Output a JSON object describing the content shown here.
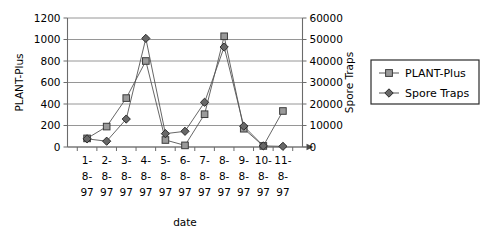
{
  "chart_data": {
    "type": "line",
    "title": "",
    "xlabel": "date",
    "categories": [
      "1-8-97",
      "2-8-97",
      "3-8-97",
      "4-8-97",
      "5-8-97",
      "6-8-97",
      "7-8-97",
      "8-8-97",
      "9-8-97",
      "10-8-97",
      "11-8-97"
    ],
    "category_lines": [
      [
        "1-",
        "8-",
        "97"
      ],
      [
        "2-",
        "8-",
        "97"
      ],
      [
        "3-",
        "8-",
        "97"
      ],
      [
        "4-",
        "8-",
        "97"
      ],
      [
        "5-",
        "8-",
        "97"
      ],
      [
        "6-",
        "8-",
        "97"
      ],
      [
        "7-",
        "8-",
        "97"
      ],
      [
        "8-",
        "8-",
        "97"
      ],
      [
        "9-",
        "8-",
        "97"
      ],
      [
        "10-",
        "8-",
        "97"
      ],
      [
        "11-",
        "8-",
        "97"
      ]
    ],
    "grid": true,
    "legend_position": "right",
    "axes": {
      "left": {
        "label": "PLANT-Plus",
        "ticks": [
          0,
          200,
          400,
          600,
          800,
          1000,
          1200
        ],
        "ylim": [
          0,
          1200
        ]
      },
      "right": {
        "label": "Spore Traps",
        "ticks": [
          0,
          10000,
          20000,
          30000,
          40000,
          50000,
          60000
        ],
        "ylim": [
          0,
          60000
        ]
      }
    },
    "series": [
      {
        "name": "PLANT-Plus",
        "axis": "left",
        "marker": "square",
        "color": "#9a9a9a",
        "values": [
          80,
          190,
          455,
          800,
          65,
          15,
          305,
          1030,
          170,
          10,
          335
        ]
      },
      {
        "name": "Spore Traps",
        "axis": "right",
        "marker": "diamond",
        "color": "#686868",
        "values": [
          3800,
          2700,
          13000,
          50500,
          6200,
          7300,
          20800,
          46500,
          9700,
          500,
          300
        ]
      }
    ]
  },
  "legend": {
    "entries": [
      {
        "label": "PLANT-Plus",
        "marker": "square"
      },
      {
        "label": "Spore Traps",
        "marker": "diamond"
      }
    ]
  }
}
